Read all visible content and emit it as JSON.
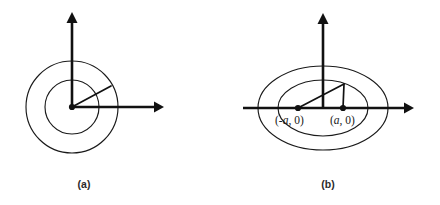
{
  "figure": {
    "background_color": "#ffffff",
    "stroke_color": "#1a1a1a",
    "panels": [
      {
        "id": "panel-a",
        "caption": "(a)",
        "caption_x": 84,
        "caption_y": 188,
        "type": "concentric-circles",
        "center": {
          "x": 72,
          "y": 107
        },
        "circles": [
          {
            "name": "inner-circle",
            "radius": 27
          },
          {
            "name": "outer-circle",
            "radius": 46
          }
        ],
        "axes": {
          "x_axis": {
            "x1": 72,
            "y1": 107,
            "x2": 162,
            "y2": 107,
            "arrow": "right"
          },
          "y_axis": {
            "x1": 72,
            "y1": 107,
            "x2": 72,
            "y2": 13,
            "arrow": "up"
          }
        },
        "radius_segment": {
          "x1": 72,
          "y1": 107,
          "x2": 111,
          "y2": 86
        },
        "labels": []
      },
      {
        "id": "panel-b",
        "caption": "(b)",
        "caption_x": 328,
        "caption_y": 188,
        "type": "confocal-ellipses",
        "center": {
          "x": 323,
          "y": 108
        },
        "ellipses": [
          {
            "name": "inner-ellipse",
            "rx": 45,
            "ry": 28
          },
          {
            "name": "outer-ellipse",
            "rx": 65,
            "ry": 42
          }
        ],
        "axes": {
          "x_axis": {
            "x1": 243,
            "y1": 108,
            "x2": 412,
            "y2": 108,
            "arrow": "right"
          },
          "y_axis": {
            "x1": 323,
            "y1": 108,
            "x2": 323,
            "y2": 14,
            "arrow": "up"
          }
        },
        "foci": [
          {
            "name": "left-focus",
            "x": 298,
            "y": 108,
            "label": "(-a, 0)",
            "label_prefix": "(-",
            "label_var": "a",
            "label_suffix": ", 0)",
            "label_x": 275,
            "label_y": 124
          },
          {
            "name": "right-focus",
            "x": 343,
            "y": 108,
            "label": "(a, 0)",
            "label_prefix": "(",
            "label_var": "a",
            "label_suffix": ", 0)",
            "label_x": 330,
            "label_y": 124
          }
        ],
        "focal_radii": [
          {
            "name": "left-focal-radius",
            "x1": 298,
            "y1": 108,
            "x2": 344,
            "y2": 84
          },
          {
            "name": "right-focal-radius",
            "x1": 343,
            "y1": 108,
            "x2": 344,
            "y2": 84
          }
        ],
        "tangency_point": {
          "x": 344,
          "y": 84
        }
      }
    ]
  }
}
